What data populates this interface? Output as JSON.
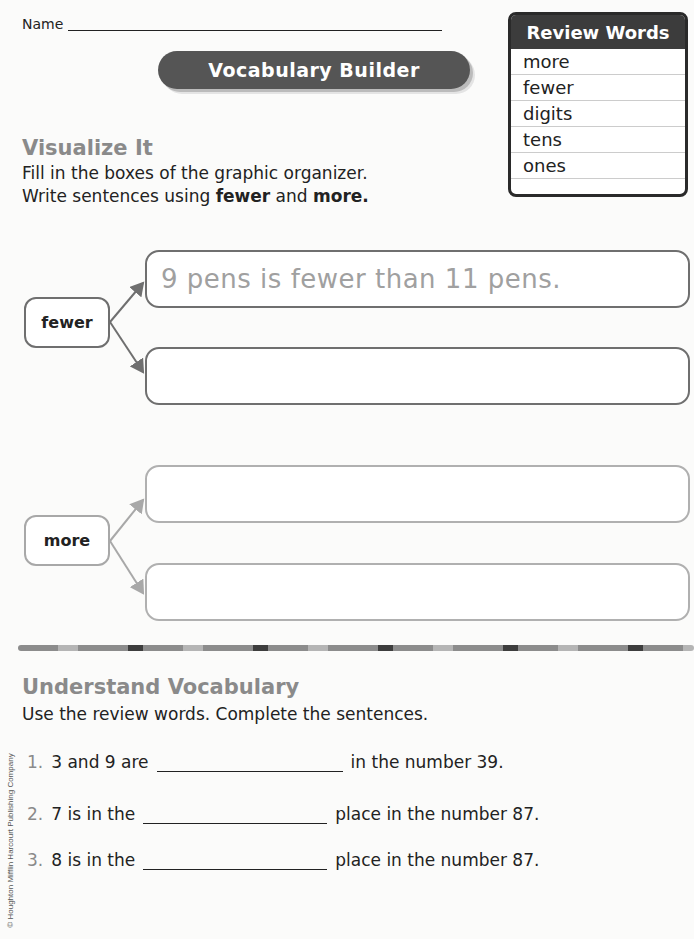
{
  "header": {
    "name_label": "Name",
    "banner_title": "Vocabulary Builder"
  },
  "review_words": {
    "title": "Review Words",
    "items": [
      "more",
      "fewer",
      "digits",
      "tens",
      "ones"
    ]
  },
  "visualize": {
    "title": "Visualize It",
    "instruction_line1": "Fill in the boxes of the graphic organizer.",
    "instruction_line2_prefix": "Write sentences using ",
    "instruction_word1": "fewer",
    "instruction_mid": " and ",
    "instruction_word2": "more."
  },
  "organizer": {
    "fewer": {
      "label": "fewer",
      "answers": [
        "9 pens is fewer than 11 pens.",
        ""
      ]
    },
    "more": {
      "label": "more",
      "answers": [
        "",
        ""
      ]
    }
  },
  "understand": {
    "title": "Understand Vocabulary",
    "instruction": "Use the review words. Complete the sentences.",
    "questions": [
      {
        "num": "1.",
        "before": "3 and 9 are",
        "after": "in the number 39."
      },
      {
        "num": "2.",
        "before": "7 is in the",
        "after": "place in the number 87."
      },
      {
        "num": "3.",
        "before": "8 is in the",
        "after": "place in the number 87."
      }
    ]
  },
  "footer": {
    "copyright": "© Houghton Mifflin Harcourt Publishing Company"
  }
}
